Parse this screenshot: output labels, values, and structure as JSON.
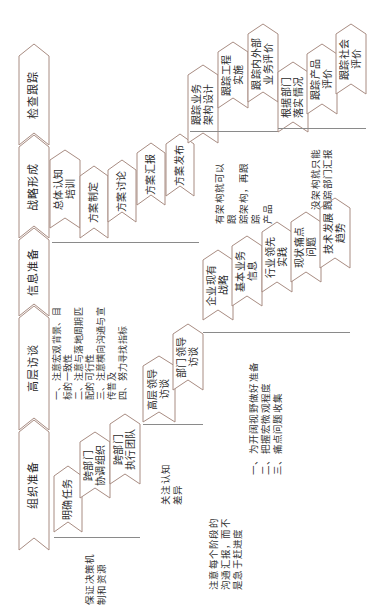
{
  "diagram": {
    "colors": {
      "outline": "#a88c82",
      "fill": "#ffffff",
      "text": "#2a2a2a",
      "brace": "#8a8a8a"
    },
    "main_chain": [
      {
        "label": "组织准备"
      },
      {
        "label": "高层访谈"
      },
      {
        "label": "信息准备"
      },
      {
        "label": "战略形成"
      },
      {
        "label": "检查跟踪"
      }
    ],
    "groups": [
      {
        "id": "organization",
        "steps": [
          "明确任务",
          "跨部门\n协调组织",
          "跨部门\n执行团队"
        ],
        "note": "保证决策机\n制和资源"
      },
      {
        "id": "interview",
        "steps": [
          "高层领导\n访谈",
          "部门领导\n访谈"
        ],
        "note": "关注认知\n差异",
        "points": "一、注意宏观背景、目\n标的一致性\n二、注意与落地周期匹\n配的可行性\n三、注意横向沟通与宣\n传普及\n四、努力寻找指标"
      },
      {
        "id": "information",
        "steps": [
          "企业现有\n战略",
          "基本业务\n信息",
          "行业领先\n实践",
          "现状痛点\n问题",
          "技术发展\n趋势"
        ],
        "note": "一、为开阔视野做好准备\n二、把握宏微观程度\n三、痛点问题收集"
      },
      {
        "id": "strategy",
        "steps": [
          "总体认知\n培训",
          "方案制定",
          "方案讨论",
          "方案汇报",
          "方案发布"
        ],
        "note": "注意每个阶段的\n沟通汇报，而不\n是急于赶进度"
      },
      {
        "id": "tracking_with_arch",
        "steps": [
          "跟踪业务\n架构设计",
          "跟踪工程\n实施",
          "跟踪内外部\n业务评价"
        ],
        "note": "有架构就可以跟\n踪架构，再跟踪\n产品"
      },
      {
        "id": "tracking_without_arch",
        "steps": [
          "根据部门\n落实情况",
          "跟踪产品\n评价",
          "跟踪社会\n评价"
        ],
        "note": "没架构就只能\n跟踪部门汇报"
      }
    ]
  }
}
